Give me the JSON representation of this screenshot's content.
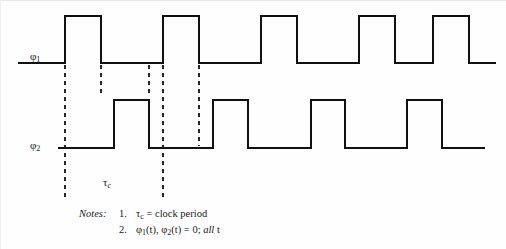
{
  "figure": {
    "background_color": "#fefefe",
    "line_color": "#111111"
  },
  "signals": [
    {
      "id": "phi1",
      "label_base": "φ",
      "label_sub": "1",
      "baseline_y": 62,
      "high_y": 15,
      "start_x": 18,
      "end_x": 494,
      "edges_x": [
        64,
        100,
        162,
        198,
        260,
        296,
        358,
        394,
        432,
        468
      ]
    },
    {
      "id": "phi2",
      "label_base": "φ",
      "label_sub": "2",
      "baseline_y": 147,
      "high_y": 99,
      "start_x": 58,
      "end_x": 483,
      "edges_x": [
        113,
        148,
        212,
        247,
        310,
        344,
        406,
        441
      ]
    }
  ],
  "dashed_guides": [
    {
      "x": 64,
      "y_top": 64,
      "y_bottom": 200
    },
    {
      "x": 100,
      "y_top": 64,
      "y_bottom": 94
    },
    {
      "x": 148,
      "y_top": 64,
      "y_bottom": 94
    },
    {
      "x": 162,
      "y_top": 64,
      "y_bottom": 200
    },
    {
      "x": 198,
      "y_top": 64,
      "y_bottom": 145
    }
  ],
  "annotations": {
    "tau_c": {
      "base": "τ",
      "sub": "c"
    }
  },
  "notes": {
    "heading": "Notes:",
    "items": [
      {
        "number": "1.",
        "text_parts": [
          {
            "type": "plain",
            "text": "τ"
          },
          {
            "type": "sub",
            "text": "c"
          },
          {
            "type": "plain",
            "text": " = clock period"
          }
        ],
        "text_flat": "τc = clock period"
      },
      {
        "number": "2.",
        "text_parts": [
          {
            "type": "plain",
            "text": "φ"
          },
          {
            "type": "sub",
            "text": "1"
          },
          {
            "type": "plain",
            "text": "(t), φ"
          },
          {
            "type": "sub",
            "text": "2"
          },
          {
            "type": "plain",
            "text": "(t) = 0; "
          },
          {
            "type": "italic",
            "text": "all"
          },
          {
            "type": "plain",
            "text": " t"
          }
        ],
        "text_flat": "φ1(t), φ2(t) = 0; all t"
      }
    ]
  }
}
